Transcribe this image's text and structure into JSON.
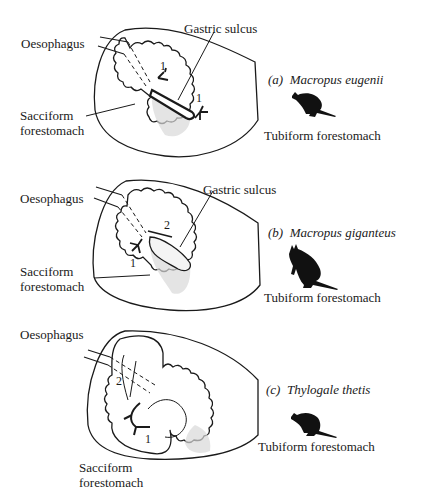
{
  "figure": {
    "panels": [
      {
        "id": "a",
        "letter": "(a)",
        "species": "Macropus eugenii",
        "labels": {
          "oesophagus": "Oesophagus",
          "gastric_sulcus": "Gastric sulcus",
          "sacciform_line1": "Sacciform",
          "sacciform_line2": "forestomach",
          "tubiform": "Tubiform forestomach"
        },
        "flow_numbers": [
          "1",
          "1"
        ],
        "animal_icon": "wallaby-silhouette"
      },
      {
        "id": "b",
        "letter": "(b)",
        "species": "Macropus giganteus",
        "labels": {
          "oesophagus": "Oesophagus",
          "gastric_sulcus": "Gastric sulcus",
          "sacciform_line1": "Sacciform",
          "sacciform_line2": "forestomach",
          "tubiform": "Tubiform forestomach"
        },
        "flow_numbers": [
          "2",
          "1"
        ],
        "animal_icon": "kangaroo-silhouette"
      },
      {
        "id": "c",
        "letter": "(c)",
        "species": "Thylogale thetis",
        "labels": {
          "oesophagus": "Oesophagus",
          "sacciform_line1": "Sacciform",
          "sacciform_line2": "forestomach",
          "tubiform": "Tubiform forestomach"
        },
        "flow_numbers": [
          "2",
          "1"
        ],
        "animal_icon": "pademelon-silhouette"
      }
    ]
  }
}
